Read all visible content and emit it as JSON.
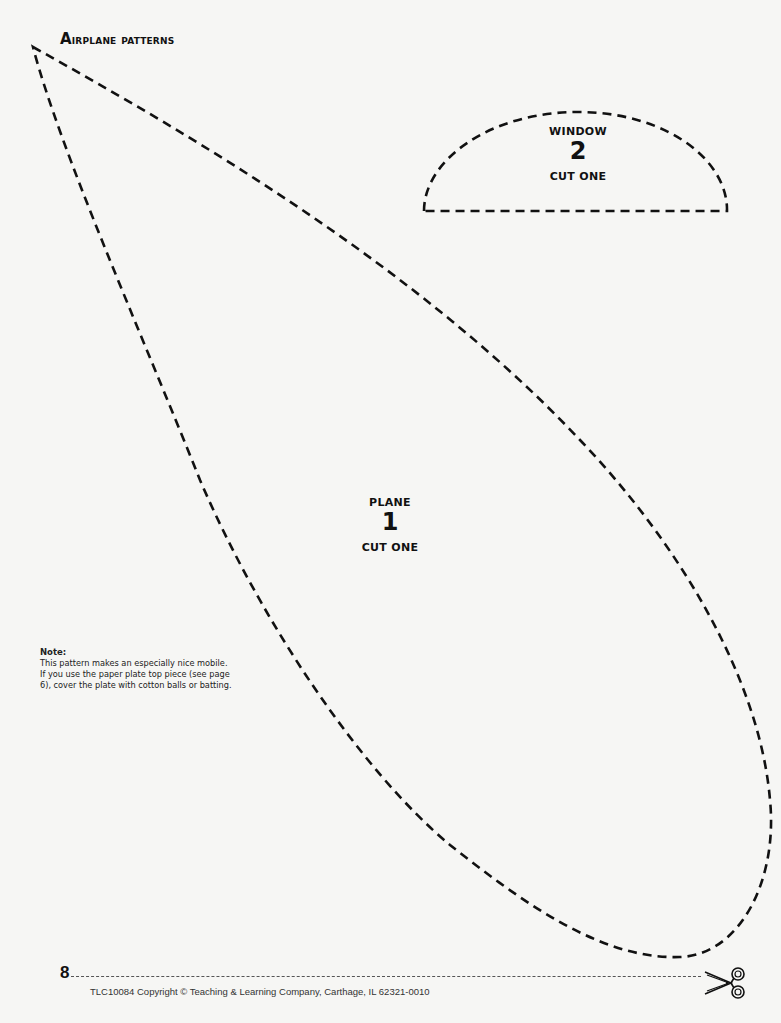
{
  "header": {
    "title_first_letter": "A",
    "title_rest": "irplane patterns"
  },
  "patterns": [
    {
      "id": "window",
      "name": "WINDOW",
      "number": "2",
      "instruction": "CUT ONE",
      "shape": "half-oval"
    },
    {
      "id": "plane",
      "name": "PLANE",
      "number": "1",
      "instruction": "CUT ONE",
      "shape": "teardrop"
    }
  ],
  "note": {
    "title": "Note:",
    "lines": [
      "This pattern makes an especially nice mobile.",
      "If you use the paper plate top piece (see page",
      "6), cover the plate with cotton balls or batting."
    ]
  },
  "footer": {
    "page_number": "8",
    "copyright": "TLC10084 Copyright © Teaching & Learning Company, Carthage, IL  62321-0010",
    "cut_icon": "scissors-icon"
  },
  "colors": {
    "ink": "#111111",
    "paper": "#f6f6f4"
  }
}
